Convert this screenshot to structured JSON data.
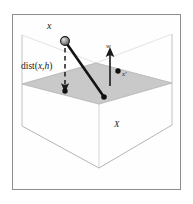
{
  "figure": {
    "kind": "geometry-diagram",
    "frame": {
      "border_color": "#8d8d8d",
      "background_color": "#fefefe"
    },
    "colors": {
      "plane_fill": "#c9c9c9",
      "plane_edge": "#a8a8a8",
      "box_edge": "#b9b9b9",
      "stroke_dark": "#1a1a1a",
      "sphere_fill": "#8c8c8c",
      "sphere_edge": "#1a1a1a",
      "label_text": "#1a1a1a"
    },
    "labels": {
      "point_x": "x",
      "normal_vector": "w",
      "projected_point": "x′",
      "instance_space": "X",
      "distance_prefix": "dist(",
      "distance_arg1": "x",
      "distance_sep": ",",
      "distance_arg2": "h",
      "distance_suffix": ")",
      "distance_full": "dist(x,h)"
    },
    "elements": {
      "sphere": {
        "cx": 65,
        "cy": 41,
        "r": 4.2
      },
      "dashed_arrow": {
        "x1": 65,
        "y1": 47,
        "x2": 65,
        "y2": 91
      },
      "solid_segment": {
        "x1": 67,
        "y1": 44,
        "x2": 104,
        "y2": 97
      },
      "normal_arrow": {
        "x1": 110,
        "y1": 86,
        "x2": 110,
        "y2": 51
      },
      "plane_point": {
        "cx": 118,
        "cy": 72,
        "r": 2.6
      },
      "plane_foot": {
        "cx": 65,
        "cy": 91,
        "r": 2.6
      },
      "plane_polygon": "22,84 96,63 172,83 99,104",
      "box_outline": "22,35 22,126 99,168 172,125 172,34"
    }
  }
}
